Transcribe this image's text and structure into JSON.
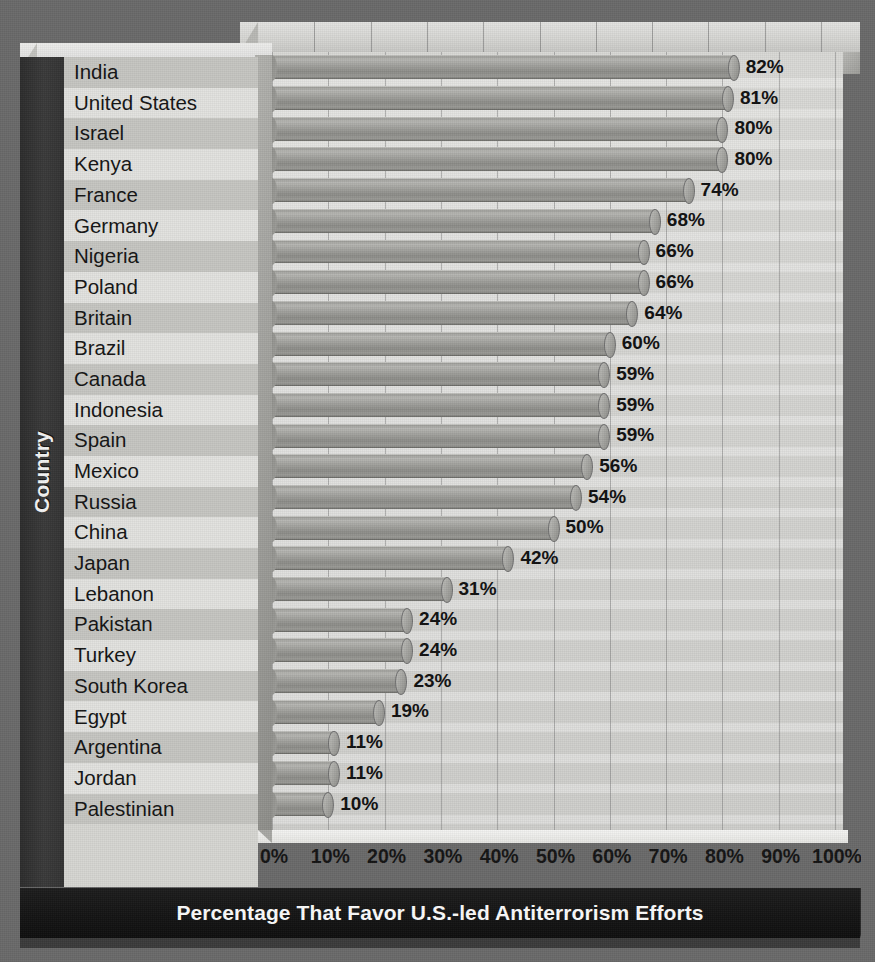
{
  "chart_data": {
    "type": "bar",
    "orientation": "horizontal",
    "title": "Percentage That Favor U.S.-led Antiterrorism Efforts",
    "xlabel": "",
    "ylabel": "Country",
    "xlim": [
      0,
      100
    ],
    "xticks": [
      "0%",
      "10%",
      "20%",
      "30%",
      "40%",
      "50%",
      "60%",
      "70%",
      "80%",
      "90%",
      "100%"
    ],
    "xtick_values": [
      0,
      10,
      20,
      30,
      40,
      50,
      60,
      70,
      80,
      90,
      100
    ],
    "grid": "vertical",
    "legend": "none",
    "categories": [
      "India",
      "United States",
      "Israel",
      "Kenya",
      "France",
      "Germany",
      "Nigeria",
      "Poland",
      "Britain",
      "Brazil",
      "Canada",
      "Indonesia",
      "Spain",
      "Mexico",
      "Russia",
      "China",
      "Japan",
      "Lebanon",
      "Pakistan",
      "Turkey",
      "South Korea",
      "Egypt",
      "Argentina",
      "Jordan",
      "Palestinian Territories"
    ],
    "values": [
      82,
      81,
      80,
      80,
      74,
      68,
      66,
      66,
      64,
      60,
      59,
      59,
      59,
      56,
      54,
      50,
      42,
      31,
      24,
      24,
      23,
      19,
      11,
      11,
      10
    ],
    "data_labels": [
      "82%",
      "81%",
      "80%",
      "80%",
      "74%",
      "68%",
      "66%",
      "66%",
      "64%",
      "60%",
      "59%",
      "59%",
      "59%",
      "56%",
      "54%",
      "50%",
      "42%",
      "31%",
      "24%",
      "24%",
      "23%",
      "19%",
      "11%",
      "11%",
      "10%"
    ]
  },
  "colors": {
    "background": "#6a6a6a",
    "plot_face": "#d4d4d1",
    "bar_fill": "#a2a29e",
    "spine_dark": "#333333",
    "title_band": "#151515",
    "text": "#141414",
    "title_text": "#fbfbfb"
  },
  "axis": {
    "y_title": "Country",
    "x_title": ""
  },
  "footer": {
    "title": "Percentage That Favor U.S.-led Antiterrorism Efforts"
  }
}
